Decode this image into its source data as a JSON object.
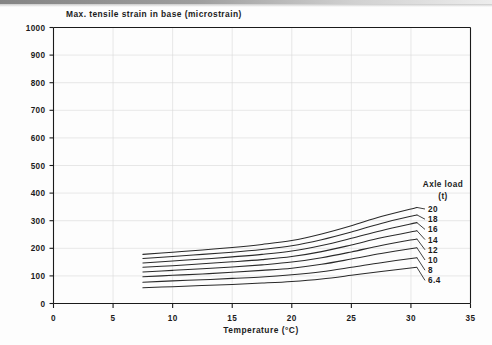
{
  "chart_data": {
    "type": "line",
    "title": "Max. tensile strain in base (microstrain)",
    "xlabel": "Temperature (°C)",
    "ylabel": "",
    "xlim": [
      0,
      35
    ],
    "ylim": [
      0,
      1000
    ],
    "xticks": [
      "0",
      "5",
      "10",
      "15",
      "20",
      "25",
      "30",
      "35"
    ],
    "xtick_values": [
      0,
      5,
      10,
      15,
      20,
      25,
      30,
      35
    ],
    "yticks": [
      "0",
      "100",
      "200",
      "300",
      "400",
      "500",
      "600",
      "700",
      "800",
      "900",
      "1000"
    ],
    "ytick_values": [
      0,
      100,
      200,
      300,
      400,
      500,
      600,
      700,
      800,
      900,
      1000
    ],
    "grid": true,
    "legend_position": "right-inside",
    "legend_title": "Axle load",
    "legend_units": "(t)",
    "x": [
      7.5,
      10,
      12.5,
      15,
      17.5,
      20,
      22.5,
      25,
      27.5,
      30.5
    ],
    "series": [
      {
        "name": "20",
        "values": [
          178,
          186,
          194,
          203,
          214,
          228,
          252,
          282,
          315,
          348
        ]
      },
      {
        "name": "18",
        "values": [
          163,
          170,
          178,
          186,
          196,
          209,
          231,
          259,
          290,
          321
        ]
      },
      {
        "name": "16",
        "values": [
          147,
          154,
          161,
          169,
          178,
          190,
          210,
          236,
          264,
          293
        ]
      },
      {
        "name": "14",
        "values": [
          131,
          137,
          144,
          151,
          159,
          170,
          188,
          212,
          238,
          264
        ]
      },
      {
        "name": "12",
        "values": [
          114,
          120,
          126,
          132,
          140,
          150,
          166,
          187,
          210,
          234
        ]
      },
      {
        "name": "10",
        "values": [
          97,
          102,
          107,
          113,
          120,
          128,
          142,
          161,
          181,
          202
        ]
      },
      {
        "name": "8",
        "values": [
          77,
          82,
          86,
          91,
          96,
          104,
          115,
          131,
          148,
          166
        ]
      },
      {
        "name": "6.4",
        "values": [
          57,
          61,
          65,
          69,
          74,
          80,
          89,
          102,
          116,
          131
        ]
      }
    ]
  },
  "legend": {
    "title": "Axle load",
    "units": "(t)",
    "entries": [
      "20",
      "18",
      "16",
      "14",
      "12",
      "10",
      "8",
      "6.4"
    ]
  },
  "axes": {
    "x_title": "Temperature (°C)",
    "x_labels": [
      "0",
      "5",
      "10",
      "15",
      "20",
      "25",
      "30",
      "35"
    ],
    "y_labels": [
      "1000",
      "900",
      "800",
      "700",
      "600",
      "500",
      "400",
      "300",
      "200",
      "100",
      "0"
    ]
  },
  "title": "Max. tensile strain in base (microstrain)",
  "colors": {
    "line": "#2a2a2a",
    "axis": "#1b1b1b",
    "grid": "#d8d8d8",
    "background": "#fdfdfd"
  }
}
